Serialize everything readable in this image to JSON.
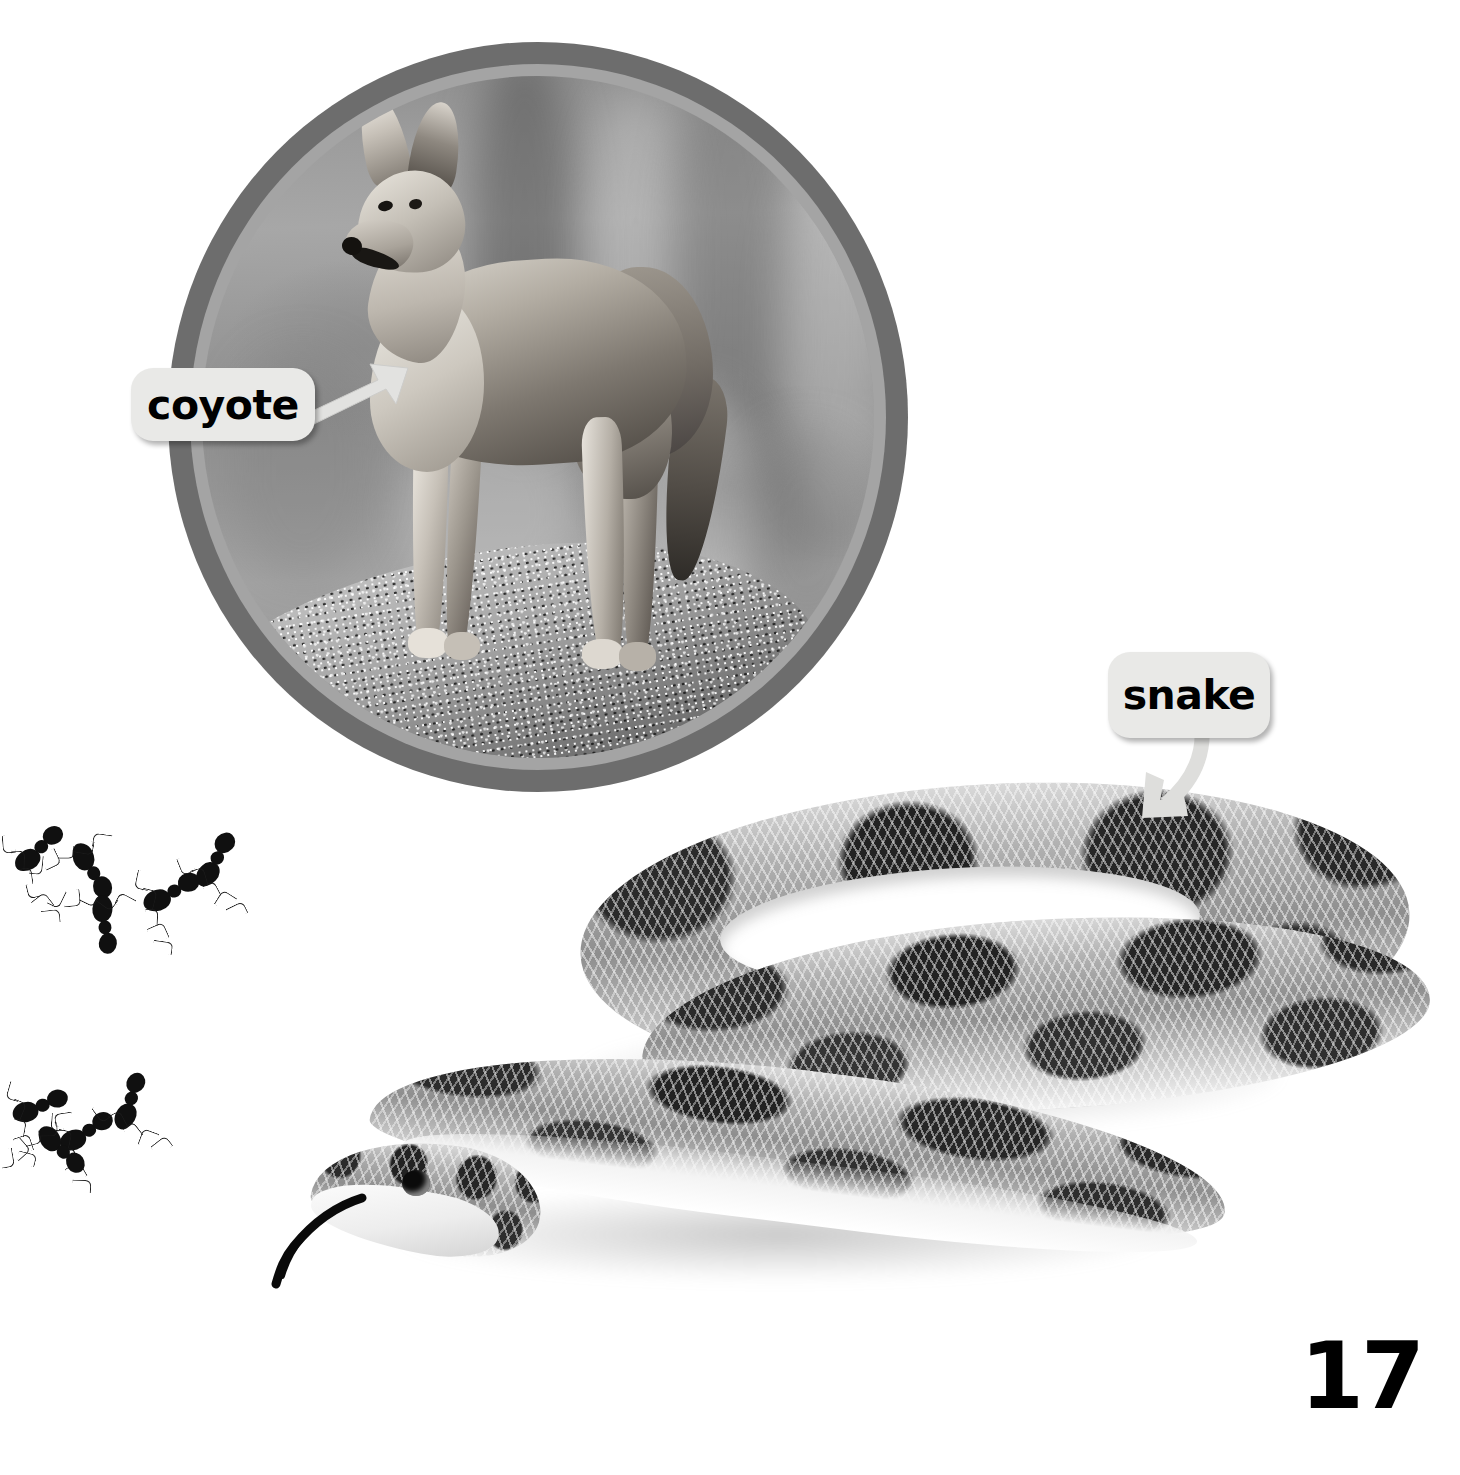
{
  "page": {
    "number": "17",
    "background_color": "#ffffff"
  },
  "colors": {
    "ring_outer": "#6d6d6d",
    "ring_inner": "#a4a4a4",
    "callout_fill": "#e9e9e7",
    "callout_text": "#000000",
    "page_number": "#000000",
    "ant_body": "#101010"
  },
  "figures": {
    "coyote": {
      "label": "coyote",
      "label_icon": "arrow-up-right-icon",
      "frame_shape": "circle",
      "subject": "coyote standing on a rock",
      "photo_style": "black-and-white photograph"
    },
    "snake": {
      "label": "snake",
      "label_icon": "arrow-curved-down-left-icon",
      "subject": "coiled blotched snake with tongue extended",
      "photo_style": "black-and-white photograph"
    },
    "ants": {
      "group_top_count": 5,
      "group_bottom_count": 4,
      "subject": "ants",
      "photo_style": "black-and-white photograph"
    }
  }
}
